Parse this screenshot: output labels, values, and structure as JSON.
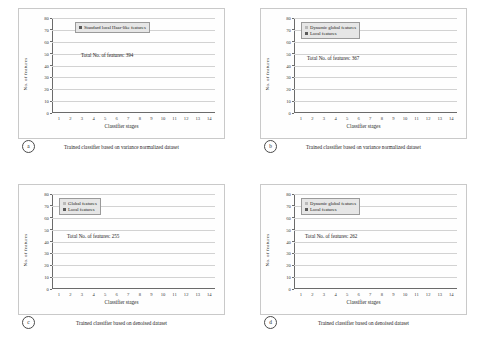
{
  "figure": {
    "panels": [
      {
        "key": "a",
        "label": "a",
        "caption": "Trained classifier based on variance normalized dataset",
        "total_text": "Total No. of features: 394",
        "chart_data": {
          "type": "bar",
          "title": "",
          "xlabel": "Classifier stages",
          "ylabel": "No. of features",
          "ylim": [
            0,
            80
          ],
          "yticks": [
            0,
            10,
            20,
            30,
            40,
            50,
            60,
            70,
            80
          ],
          "grid": true,
          "legend_position": "top-left",
          "categories": [
            "1",
            "2",
            "3",
            "4",
            "5",
            "6",
            "7",
            "8",
            "9",
            "10",
            "11",
            "12",
            "13",
            "14"
          ],
          "series": [
            {
              "name": "Standard local Haar-like features",
              "color": "#5a5a5a",
              "values": [
                2,
                6,
                9,
                11,
                13.5,
                17.5,
                19.5,
                26,
                29.5,
                32,
                41,
                48,
                62,
                69
              ]
            }
          ]
        }
      },
      {
        "key": "b",
        "label": "b",
        "caption": "Trained classifier based on variance normalized dataset",
        "total_text": "Total No. of features: 367",
        "chart_data": {
          "type": "bar",
          "title": "",
          "xlabel": "Classifier stages",
          "ylabel": "No. of features",
          "ylim": [
            0,
            80
          ],
          "yticks": [
            0,
            10,
            20,
            30,
            40,
            50,
            60,
            70,
            80
          ],
          "grid": true,
          "legend_position": "top-left",
          "stacked": true,
          "categories": [
            "1",
            "2",
            "3",
            "4",
            "5",
            "6",
            "7",
            "8",
            "9",
            "10",
            "11",
            "12",
            "13",
            "14"
          ],
          "series": [
            {
              "name": "Local features",
              "color": "#5a5a5a",
              "values": [
                1.5,
                5,
                7.5,
                8.5,
                9.5,
                11,
                11,
                18,
                21,
                28.5,
                30.5,
                32.5,
                38.5,
                47.5
              ]
            },
            {
              "name": "Dynamic global features",
              "color": "#b9b9b9",
              "values": [
                0,
                1,
                1,
                1,
                3,
                4,
                8.5,
                7,
                5,
                0.5,
                16.5,
                14.5,
                12.5,
                11.5
              ]
            }
          ]
        }
      },
      {
        "key": "c",
        "label": "c",
        "caption": "Trained classifier based on denoised dataset",
        "total_text": "Total No. of features: 255",
        "chart_data": {
          "type": "bar",
          "title": "",
          "xlabel": "Classifier stages",
          "ylabel": "No. of features",
          "ylim": [
            0,
            80
          ],
          "yticks": [
            0,
            10,
            20,
            30,
            40,
            50,
            60,
            70,
            80
          ],
          "grid": true,
          "legend_position": "top-left",
          "stacked": true,
          "categories": [
            "1",
            "2",
            "3",
            "4",
            "5",
            "6",
            "7",
            "8",
            "9",
            "10",
            "11",
            "12",
            "13",
            "14"
          ],
          "series": [
            {
              "name": "Local features",
              "color": "#5a5a5a",
              "values": [
                2,
                3,
                4.5,
                7.5,
                11.5,
                13.5,
                16,
                17.5,
                20.5,
                19.5,
                24,
                26.5,
                29.5,
                35
              ]
            },
            {
              "name": "Global features",
              "color": "#b9b9b9",
              "values": [
                0,
                0,
                0.5,
                0,
                0,
                0,
                0,
                1,
                0.5,
                2,
                0.5,
                0.5,
                0.5,
                5.5
              ]
            }
          ]
        }
      },
      {
        "key": "d",
        "label": "d",
        "caption": "Trained classifier based on denoised dataset",
        "total_text": "Total No. of features: 262",
        "chart_data": {
          "type": "bar",
          "title": "",
          "xlabel": "Classifier stages",
          "ylabel": "No. of features",
          "ylim": [
            0,
            80
          ],
          "yticks": [
            0,
            10,
            20,
            30,
            40,
            50,
            60,
            70,
            80
          ],
          "grid": true,
          "legend_position": "top-left",
          "stacked": true,
          "categories": [
            "1",
            "2",
            "3",
            "4",
            "5",
            "6",
            "7",
            "8",
            "9",
            "10",
            "11",
            "12",
            "13",
            "14"
          ],
          "series": [
            {
              "name": "Local features",
              "color": "#5a5a5a",
              "values": [
                1.5,
                3,
                4,
                5.5,
                1.5,
                1,
                15,
                16,
                20,
                26,
                25,
                33,
                34,
                44.5
              ]
            },
            {
              "name": "Dynamic global features",
              "color": "#b9b9b9",
              "values": [
                0,
                0,
                0.5,
                0.5,
                9,
                9,
                0,
                0,
                0,
                0,
                0,
                0,
                0,
                0
              ]
            }
          ]
        }
      }
    ]
  }
}
